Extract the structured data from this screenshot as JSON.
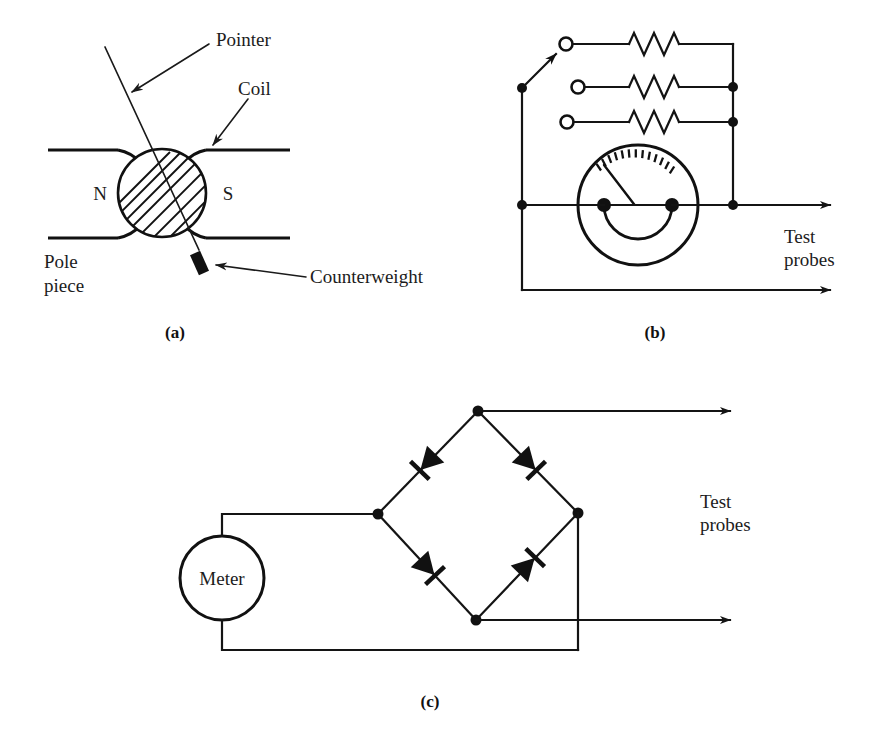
{
  "figure": {
    "background_color": "#ffffff",
    "ink_color": "#111111"
  },
  "panel_a": {
    "caption": "(a)",
    "labels": {
      "pointer": "Pointer",
      "coil": "Coil",
      "counterweight": "Counterweight",
      "pole_piece_line1": "Pole",
      "pole_piece_line2": "piece",
      "north": "N",
      "south": "S"
    }
  },
  "panel_b": {
    "caption": "(b)",
    "labels": {
      "test_probes_line1": "Test",
      "test_probes_line2": "probes"
    },
    "components": {
      "resistor_count": 3,
      "switch_contacts": 3,
      "selected_contact_index": 0,
      "meter": "analog-meter-face"
    }
  },
  "panel_c": {
    "caption": "(c)",
    "labels": {
      "meter": "Meter",
      "test_probes_line1": "Test",
      "test_probes_line2": "probes"
    },
    "components": {
      "diode_count": 4,
      "bridge": "full-wave-bridge-rectifier"
    }
  }
}
